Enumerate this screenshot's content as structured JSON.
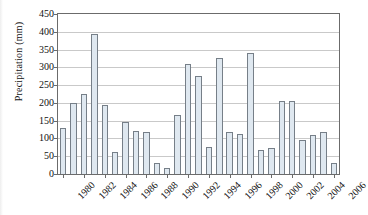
{
  "chart_data": {
    "type": "bar",
    "title": "",
    "xlabel": "",
    "ylabel": "Precipitation (mm)",
    "ylim": [
      0,
      450
    ],
    "ytick_step": 50,
    "yticks": [
      0,
      50,
      100,
      150,
      200,
      250,
      300,
      350,
      400,
      450
    ],
    "ytick_labels": [
      "0",
      "50",
      "100",
      "150",
      "200",
      "250",
      "300",
      "350",
      "400",
      "450"
    ],
    "grid": true,
    "legend": null,
    "xtick_step": 2,
    "xtick_labels": [
      "1980",
      "1982",
      "1984",
      "1986",
      "1988",
      "1990",
      "1992",
      "1994",
      "1996",
      "1998",
      "2000",
      "2002",
      "2004",
      "2006"
    ],
    "categories": [
      "1980",
      "1981",
      "1982",
      "1983",
      "1984",
      "1985",
      "1986",
      "1987",
      "1988",
      "1989",
      "1990",
      "1991",
      "1992",
      "1993",
      "1994",
      "1995",
      "1996",
      "1997",
      "1998",
      "1999",
      "2000",
      "2001",
      "2002",
      "2003",
      "2004",
      "2005",
      "2006"
    ],
    "values": [
      130,
      200,
      225,
      395,
      195,
      62,
      145,
      122,
      118,
      32,
      18,
      165,
      310,
      275,
      75,
      325,
      118,
      112,
      340,
      68,
      72,
      205,
      205,
      97,
      110,
      118,
      30
    ],
    "bar_fill_color": "#dfe8f0",
    "bar_edge_color": "#767f88",
    "axis_color": "#6b6b6b",
    "grid_color": "#c9c9c9",
    "background_color": "#ffffff"
  }
}
